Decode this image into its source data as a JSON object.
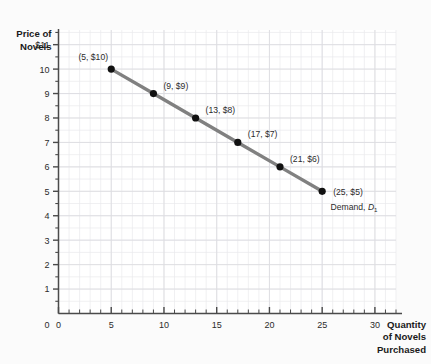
{
  "chart_data": {
    "type": "line",
    "title": "",
    "subtitle": "",
    "xlabel": "Quantity of Novels Purchased",
    "ylabel": "Price of Novels",
    "xlim": [
      0,
      32
    ],
    "ylim": [
      0,
      11.6
    ],
    "grid": true,
    "legend_position": "inline-annotation",
    "series": [
      {
        "name": "Demand, D1",
        "color": "#808080",
        "marker_color": "#111111",
        "x": [
          5,
          9,
          13,
          17,
          21,
          25
        ],
        "y": [
          10,
          9,
          8,
          7,
          6,
          5
        ],
        "point_labels": [
          "(5, $10)",
          "(9, $9)",
          "(13, $8)",
          "(17, $7)",
          "(21, $6)",
          "(25, $5)"
        ]
      }
    ],
    "annotations": [
      {
        "text_prefix": "Demand, ",
        "text_italic": "D",
        "text_sub": "1",
        "x": 25.8,
        "y": 4.25
      }
    ],
    "x_ticks": [
      0,
      5,
      10,
      15,
      20,
      25,
      30
    ],
    "x_tick_labels": [
      "0",
      "5",
      "10",
      "15",
      "20",
      "25",
      "30"
    ],
    "x_minor_step": 1,
    "y_ticks": [
      1,
      2,
      3,
      4,
      5,
      6,
      7,
      8,
      9,
      10,
      11
    ],
    "y_tick_labels": [
      "1",
      "2",
      "3",
      "4",
      "5",
      "6",
      "7",
      "8",
      "9",
      "10",
      "$11"
    ],
    "y_origin_label": "0",
    "y_minor_step": 0.5
  },
  "ylabel_lines": [
    "Price of",
    "Novels"
  ],
  "xlabel_lines": [
    "Quantity",
    "of Novels",
    "Purchased"
  ],
  "colors": {
    "background": "#fbfbfb",
    "plot_background": "#ffffff",
    "grid_minor": "#e9e9ec",
    "grid_major": "#dcdce1",
    "axis": "#4a4a4a",
    "curve": "#808080",
    "marker": "#111111",
    "text": "#2b2b2b"
  }
}
